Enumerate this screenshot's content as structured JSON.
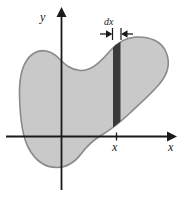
{
  "figure": {
    "name": "area-under-curve-differential-strip-diagram",
    "background_color": "#ffffff"
  },
  "axes": {
    "x_axis": {
      "label": "x",
      "name": "x-axis",
      "arrow": true,
      "color": "#1a1a1a",
      "y_pixel": 136,
      "x_start": 6,
      "x_end": 172
    },
    "y_axis": {
      "label": "y",
      "name": "y-axis",
      "arrow": true,
      "color": "#1a1a1a",
      "x_pixel": 61,
      "y_start": 9,
      "y_end": 190
    },
    "tick": {
      "label": "x",
      "position_x": 116,
      "name": "x-tick-mark"
    }
  },
  "region": {
    "name": "shaded-blob-region",
    "fill_color": "#c9c9c9",
    "stroke_color": "#8a8a8a"
  },
  "strip": {
    "name": "differential-strip",
    "label": "dx",
    "fill_color": "#3a3a3a",
    "left_x": 113,
    "right_x": 120
  },
  "annotation": {
    "dx_label": "dx",
    "left_arrow": "arrow-pointing-right",
    "right_arrow": "arrow-pointing-left",
    "color": "#1a1a1a"
  }
}
